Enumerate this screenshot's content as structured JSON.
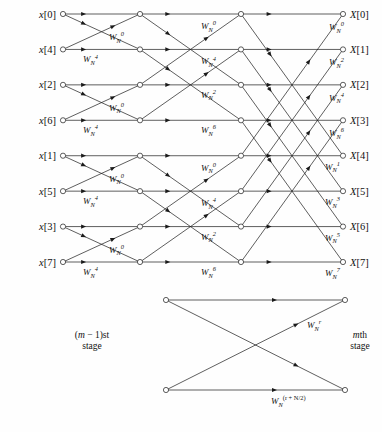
{
  "figure": {
    "n_points": 8,
    "n_stages": 3,
    "colors": {
      "line": "#1a1a1a",
      "node_fill": "#ffffff",
      "text": "#111111",
      "background": "#fefefe"
    }
  },
  "inputs": [
    {
      "label": "x[0]",
      "row": 0
    },
    {
      "label": "x[4]",
      "row": 1
    },
    {
      "label": "x[2]",
      "row": 2
    },
    {
      "label": "x[6]",
      "row": 3
    },
    {
      "label": "x[1]",
      "row": 4
    },
    {
      "label": "x[5]",
      "row": 5
    },
    {
      "label": "x[3]",
      "row": 6
    },
    {
      "label": "x[7]",
      "row": 7
    }
  ],
  "outputs": [
    {
      "label": "X[0]",
      "row": 0
    },
    {
      "label": "X[1]",
      "row": 1
    },
    {
      "label": "X[2]",
      "row": 2
    },
    {
      "label": "X[3]",
      "row": 3
    },
    {
      "label": "X[4]",
      "row": 4
    },
    {
      "label": "X[5]",
      "row": 5
    },
    {
      "label": "X[6]",
      "row": 6
    },
    {
      "label": "X[7]",
      "row": 7
    }
  ],
  "twiddles": {
    "stage1": [
      {
        "base": "W",
        "sub": "N",
        "sup": "0"
      },
      {
        "base": "W",
        "sub": "N",
        "sup": "4"
      },
      {
        "base": "W",
        "sub": "N",
        "sup": "0"
      },
      {
        "base": "W",
        "sub": "N",
        "sup": "4"
      },
      {
        "base": "W",
        "sub": "N",
        "sup": "0"
      },
      {
        "base": "W",
        "sub": "N",
        "sup": "4"
      },
      {
        "base": "W",
        "sub": "N",
        "sup": "0"
      },
      {
        "base": "W",
        "sub": "N",
        "sup": "4"
      }
    ],
    "stage2": [
      {
        "base": "W",
        "sub": "N",
        "sup": "0"
      },
      {
        "base": "W",
        "sub": "N",
        "sup": "2"
      },
      {
        "base": "W",
        "sub": "N",
        "sup": "4"
      },
      {
        "base": "W",
        "sub": "N",
        "sup": "6"
      },
      {
        "base": "W",
        "sub": "N",
        "sup": "0"
      },
      {
        "base": "W",
        "sub": "N",
        "sup": "2"
      },
      {
        "base": "W",
        "sub": "N",
        "sup": "4"
      },
      {
        "base": "W",
        "sub": "N",
        "sup": "6"
      }
    ],
    "stage3": [
      {
        "base": "W",
        "sub": "N",
        "sup": "0"
      },
      {
        "base": "W",
        "sub": "N",
        "sup": "1"
      },
      {
        "base": "W",
        "sub": "N",
        "sup": "2"
      },
      {
        "base": "W",
        "sub": "N",
        "sup": "3"
      },
      {
        "base": "W",
        "sub": "N",
        "sup": "4"
      },
      {
        "base": "W",
        "sub": "N",
        "sup": "5"
      },
      {
        "base": "W",
        "sub": "N",
        "sup": "6"
      },
      {
        "base": "W",
        "sub": "N",
        "sup": "7"
      }
    ]
  },
  "legend": {
    "left_stage_line1": "(m − 1)st",
    "left_stage_line2": "stage",
    "right_stage_line1": "mth",
    "right_stage_line2": "stage",
    "top_twiddle": {
      "base": "W",
      "sub": "N",
      "sup": "r"
    },
    "bottom_twiddle": {
      "base": "W",
      "sub": "N",
      "sup": "(r + N/2)"
    }
  },
  "chart_data": {
    "type": "diagram",
    "stages": 3,
    "input_order": [
      "x[0]",
      "x[4]",
      "x[2]",
      "x[6]",
      "x[1]",
      "x[5]",
      "x[3]",
      "x[7]"
    ],
    "output_order": [
      "X[0]",
      "X[1]",
      "X[2]",
      "X[3]",
      "X[4]",
      "X[5]",
      "X[6]",
      "X[7]"
    ],
    "stage1_twiddle_exponents": [
      0,
      4,
      0,
      4,
      0,
      4,
      0,
      4
    ],
    "stage2_twiddle_exponents": [
      0,
      2,
      4,
      6,
      0,
      2,
      4,
      6
    ],
    "stage3_twiddle_exponents": [
      0,
      1,
      2,
      3,
      4,
      5,
      6,
      7
    ],
    "stage1_pairs": [
      [
        0,
        1
      ],
      [
        2,
        3
      ],
      [
        4,
        5
      ],
      [
        6,
        7
      ]
    ],
    "stage2_pairs": [
      [
        0,
        2
      ],
      [
        1,
        3
      ],
      [
        4,
        6
      ],
      [
        5,
        7
      ]
    ],
    "stage3_pairs": [
      [
        0,
        4
      ],
      [
        1,
        5
      ],
      [
        2,
        6
      ],
      [
        3,
        7
      ]
    ]
  }
}
